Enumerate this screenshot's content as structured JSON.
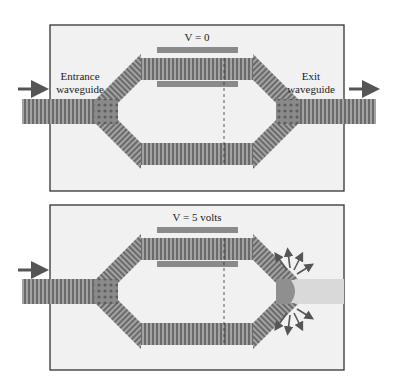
{
  "figure": {
    "panels": [
      {
        "id": "off",
        "voltage_label": "V = 0",
        "entrance_label_line1": "Entrance",
        "entrance_label_line2": "waveguide",
        "exit_label_line1": "Exit",
        "exit_label_line2": "waveguide",
        "output_state": "transmitted"
      },
      {
        "id": "on",
        "voltage_label": "V = 5 volts",
        "output_state": "scattered"
      }
    ],
    "colors": {
      "background": "#ffffff",
      "panel_fill": "#f1f1f1",
      "panel_border": "#333333",
      "waveguide_dark": "#6e6e6e",
      "waveguide_light": "#a8a8a8",
      "electrode": "#8a8a8a",
      "arrow": "#555555",
      "dim_output": "#d9d9d9"
    }
  }
}
